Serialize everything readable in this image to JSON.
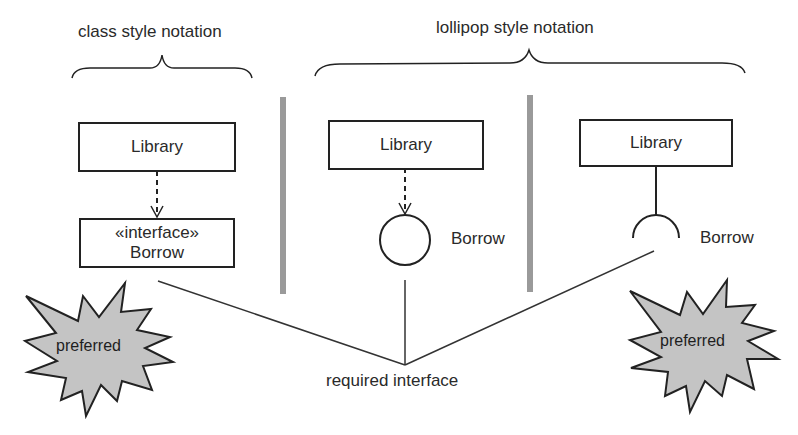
{
  "diagram": {
    "sections": {
      "class_style": {
        "title": "class style notation"
      },
      "lollipop_style": {
        "title": "lollipop style notation"
      }
    },
    "class_style": {
      "library_box": "Library",
      "interface_stereotype": "«interface»",
      "interface_name": "Borrow",
      "relation": "dependency (dashed arrow)"
    },
    "lollipop_provided": {
      "library_box": "Library",
      "interface_name": "Borrow",
      "symbol": "circle (ball)",
      "relation": "dependency (dashed arrow)"
    },
    "lollipop_required": {
      "library_box": "Library",
      "interface_name": "Borrow",
      "symbol": "half-circle (socket)",
      "relation": "solid line"
    },
    "badges": {
      "left": "preferred",
      "right": "preferred"
    },
    "callout": "required interface",
    "colors": {
      "line": "#222222",
      "separator": "#9a9a9a",
      "badge_fill": "#c4c4c4",
      "text": "#2a2a2a"
    }
  }
}
